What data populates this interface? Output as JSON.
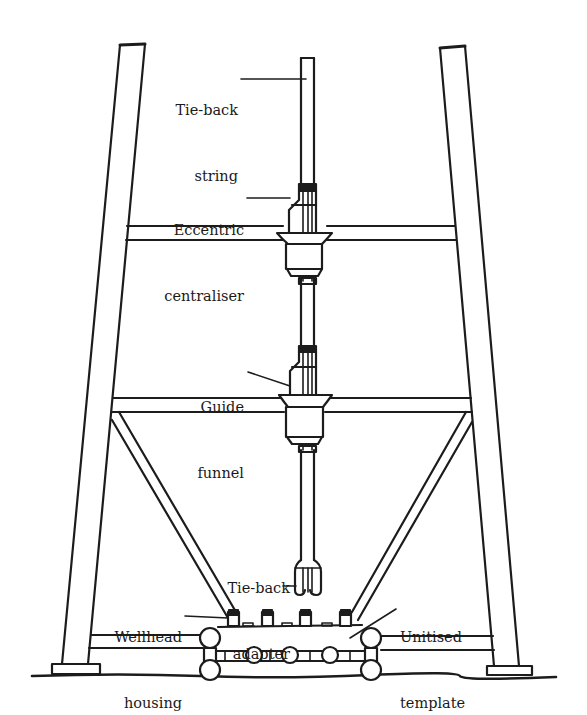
{
  "figure": {
    "colors": {
      "ink": "#1c1c1c",
      "background": "#ffffff"
    }
  },
  "labels": {
    "tieback_string": {
      "line1": "Tie-back",
      "line2": "string"
    },
    "eccentric_centraliser": {
      "line1": "Eccentric",
      "line2": "centraliser"
    },
    "guide_funnel": {
      "line1": "Guide",
      "line2": "funnel"
    },
    "tieback_adapter": {
      "line1": "Tie-back",
      "line2": "adapter"
    },
    "wellhead_housing": {
      "line1": "Wellhead",
      "line2": "housing"
    },
    "unitised_template": {
      "line1": "Unitised",
      "line2": "template"
    }
  }
}
